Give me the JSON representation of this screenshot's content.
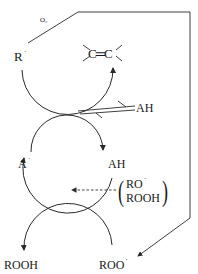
{
  "diagram": {
    "title": "",
    "type": "autoxidation-inhibition-cycle",
    "labels": {
      "oxygen": "O₂",
      "alkyl_radical": "R",
      "alkyl_radical_dot": "˙",
      "alkene": "C═C",
      "antioxidant": "AH",
      "antioxidant_radical": "A",
      "antioxidant_radical_dot": "˙",
      "alkoxy_radical": "RO",
      "alkoxy_radical_dot": "˙",
      "hydroperoxide_inner": "ROOH",
      "hydroperoxide": "ROOH",
      "peroxy_radical": "ROO",
      "peroxy_radical_dot": "˙"
    },
    "nodes": [
      {
        "id": "R",
        "text": "R˙"
      },
      {
        "id": "CC",
        "text": "C=C"
      },
      {
        "id": "AR",
        "text": "(AR)"
      },
      {
        "id": "A",
        "text": "A˙"
      },
      {
        "id": "AH",
        "text": "AH"
      },
      {
        "id": "RO_ROOH",
        "text": "(RO˙ / ROOH)"
      },
      {
        "id": "ROOH",
        "text": "ROOH"
      },
      {
        "id": "ROO",
        "text": "ROO˙"
      }
    ],
    "edges": [
      {
        "from": "R",
        "to": "ROO",
        "label": "O₂",
        "style": "solid-line-arrow"
      },
      {
        "from": "R",
        "to": "CC",
        "style": "curved-arrow"
      },
      {
        "from": "AH",
        "to": "A",
        "style": "curved-arrow"
      },
      {
        "from": "ROO",
        "to": "ROOH",
        "style": "curved-arrow"
      },
      {
        "from": "RO_ROOH",
        "to": "contact-point",
        "style": "dashed-arrow"
      },
      {
        "from": "AR",
        "to": "contact-point",
        "style": "double-line"
      }
    ],
    "colors": {
      "line": "#2a2a2a",
      "background": "#ffffff"
    }
  }
}
